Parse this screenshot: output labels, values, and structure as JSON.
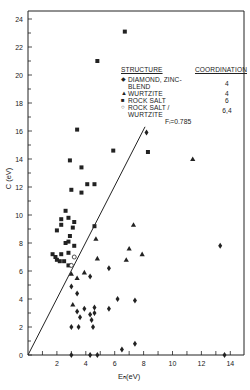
{
  "chart_data": {
    "type": "scatter",
    "title": "",
    "xlabel": "E_h (eV)",
    "ylabel": "C (eV)",
    "xlim": [
      0,
      15
    ],
    "ylim": [
      0,
      24.5
    ],
    "x_ticks": [
      2,
      4,
      6,
      8,
      10,
      12,
      14
    ],
    "y_ticks": [
      0,
      2,
      4,
      6,
      8,
      10,
      12,
      14,
      16,
      18,
      20,
      22,
      24
    ],
    "grid": false,
    "legend_position": "upper right",
    "legend_title": "STRUCTURE",
    "legend_column2_title": "COORDINATION",
    "line": {
      "label": "F_i = 0.785",
      "x": [
        0,
        8.1
      ],
      "y": [
        0,
        16.3
      ]
    },
    "series": [
      {
        "name": "DIAMOND, ZINC-BLEND",
        "marker": "diamond",
        "coordination": "4",
        "points": [
          [
            8.2,
            15.9
          ],
          [
            5.6,
            6.2
          ],
          [
            3.0,
            4.9
          ],
          [
            3.4,
            4.4
          ],
          [
            4.3,
            5.6
          ],
          [
            4.6,
            3.4
          ],
          [
            4.6,
            3.0
          ],
          [
            3.9,
            3.3
          ],
          [
            3.4,
            3.1
          ],
          [
            3.6,
            2.7
          ],
          [
            4.3,
            2.9
          ],
          [
            4.4,
            2.5
          ],
          [
            4.5,
            2.0
          ],
          [
            3.0,
            2.0
          ],
          [
            3.5,
            2.0
          ],
          [
            5.6,
            3.3
          ],
          [
            6.2,
            4.0
          ],
          [
            7.4,
            3.9
          ],
          [
            13.3,
            7.8
          ],
          [
            6.5,
            0.4
          ],
          [
            7.4,
            0.8
          ],
          [
            3.0,
            0.0
          ],
          [
            4.3,
            0.0
          ],
          [
            4.8,
            0.0
          ],
          [
            13.6,
            0.0
          ]
        ]
      },
      {
        "name": "WURTZITE",
        "marker": "triangle",
        "coordination": "4",
        "points": [
          [
            11.4,
            14.0
          ],
          [
            7.3,
            9.3
          ],
          [
            4.7,
            8.3
          ],
          [
            7.0,
            7.6
          ],
          [
            7.9,
            7.2
          ],
          [
            4.8,
            6.9
          ],
          [
            6.8,
            6.8
          ],
          [
            3.0,
            5.8
          ],
          [
            3.4,
            5.5
          ],
          [
            3.9,
            5.9
          ],
          [
            3.1,
            3.6
          ]
        ]
      },
      {
        "name": "ROCK SALT",
        "marker": "square",
        "coordination": "6",
        "points": [
          [
            6.7,
            23.1
          ],
          [
            4.8,
            21.0
          ],
          [
            3.4,
            16.1
          ],
          [
            5.9,
            14.6
          ],
          [
            8.3,
            14.5
          ],
          [
            2.9,
            13.9
          ],
          [
            3.7,
            13.4
          ],
          [
            4.6,
            12.2
          ],
          [
            3.0,
            11.8
          ],
          [
            3.7,
            11.6
          ],
          [
            4.1,
            12.2
          ],
          [
            2.6,
            10.3
          ],
          [
            2.3,
            9.7
          ],
          [
            2.8,
            9.8
          ],
          [
            3.2,
            9.5
          ],
          [
            2.3,
            9.3
          ],
          [
            2.0,
            8.9
          ],
          [
            3.1,
            9.1
          ],
          [
            2.9,
            8.5
          ],
          [
            2.6,
            8.0
          ],
          [
            2.8,
            8.1
          ],
          [
            3.2,
            7.8
          ],
          [
            1.9,
            7.0
          ],
          [
            1.7,
            7.2
          ],
          [
            2.3,
            7.2
          ],
          [
            2.0,
            6.8
          ],
          [
            2.2,
            6.7
          ],
          [
            2.5,
            6.7
          ],
          [
            2.8,
            7.3
          ],
          [
            2.8,
            6.4
          ],
          [
            4.6,
            9.2
          ]
        ]
      },
      {
        "name": "ROCK SALT / WURTZITE",
        "marker": "open-circle",
        "coordination": "6,4",
        "points": [
          [
            3.2,
            7.0
          ],
          [
            3.0,
            6.4
          ]
        ]
      }
    ]
  },
  "legend": {
    "header_structure": "STRUCTURE",
    "header_coordination": "COORDINATION",
    "items": [
      {
        "symbol": "◆",
        "label_line1": "DIAMOND, ZINC-",
        "label_line2": "BLEND",
        "coordination": "4"
      },
      {
        "symbol": "▲",
        "label_line1": "WURTZITE",
        "label_line2": "",
        "coordination": "4"
      },
      {
        "symbol": "■",
        "label_line1": "ROCK SALT",
        "label_line2": "",
        "coordination": "6"
      },
      {
        "symbol": "○",
        "label_line1": "ROCK SALT /",
        "label_line2": "WURTZITE",
        "coordination": "6,4"
      }
    ]
  },
  "annotation": "Fᵢ=0.785",
  "axis": {
    "xlabel": "Eₕ(eV)",
    "ylabel": "C (eV)"
  }
}
